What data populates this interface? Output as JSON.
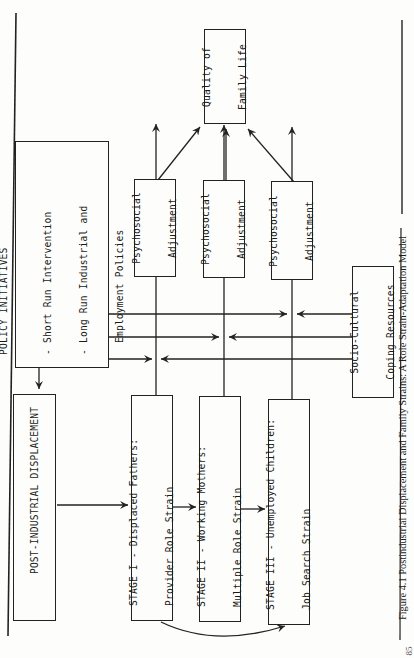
{
  "diagram": {
    "policy_box": {
      "title": "POLICY INITIATIVES",
      "items": [
        "- Short Run Intervention",
        "- Long Run Industrial and",
        "  Employment Policies"
      ]
    },
    "displacement_box": {
      "label": "POST-INDUSTRIAL DISPLACEMENT"
    },
    "stages": [
      {
        "line1": "STAGE I - Displaced Fathers:",
        "line2": "Provider Role Strain"
      },
      {
        "line1": "STAGE II - Working Mothers:",
        "line2": "Multiple Role Strain"
      },
      {
        "line1": "STAGE III - Unemployed Children:",
        "line2": "Job Search Strain"
      }
    ],
    "adjustments": [
      {
        "line1": "Psychosocial",
        "line2": "Adjustment"
      },
      {
        "line1": "Psychosocial",
        "line2": "Adjustment"
      },
      {
        "line1": "Psychosocial",
        "line2": "Adjustment"
      }
    ],
    "outcome_box": {
      "line1": "Quality of",
      "line2": "Family Life"
    },
    "coping_box": {
      "line1": "Socio-Cultural",
      "line2": "Coping Resources"
    },
    "edges": [
      {
        "from": "POLICY INITIATIVES",
        "to": "POST-INDUSTRIAL DISPLACEMENT"
      },
      {
        "from": "POST-INDUSTRIAL DISPLACEMENT",
        "to": "STAGE I"
      },
      {
        "from": "STAGE I",
        "to": "STAGE II"
      },
      {
        "from": "STAGE II",
        "to": "STAGE III"
      },
      {
        "from": "STAGE I",
        "to": "STAGE III",
        "style": "curved"
      },
      {
        "from": "STAGE I",
        "to": "Psychosocial Adjustment 1"
      },
      {
        "from": "STAGE II",
        "to": "Psychosocial Adjustment 2"
      },
      {
        "from": "STAGE III",
        "to": "Psychosocial Adjustment 3"
      },
      {
        "from": "POLICY INITIATIVES",
        "to": "Stage I link"
      },
      {
        "from": "POLICY INITIATIVES",
        "to": "Stage II link"
      },
      {
        "from": "POLICY INITIATIVES",
        "to": "Stage III link"
      },
      {
        "from": "Socio-Cultural Coping Resources",
        "to": "Stage I link"
      },
      {
        "from": "Socio-Cultural Coping Resources",
        "to": "Stage II link"
      },
      {
        "from": "Socio-Cultural Coping Resources",
        "to": "Stage III link"
      },
      {
        "from": "Psychosocial Adjustment 1",
        "to": "Quality of Family Life"
      },
      {
        "from": "Psychosocial Adjustment 2",
        "to": "Quality of Family Life"
      },
      {
        "from": "Psychosocial Adjustment 3",
        "to": "Quality of Family Life"
      }
    ]
  },
  "caption": "Figure 4.1   Postindustrial Displacement and Family Strains: A Role Strain-Adaptation Model",
  "page_number": "85"
}
